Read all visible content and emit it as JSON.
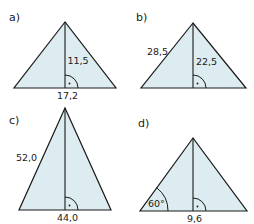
{
  "figures": [
    {
      "id": "a",
      "label": "a)",
      "height_label": "11,5",
      "base_label": "17,2",
      "right_angle_marker": true,
      "fill_color": "#dcecf0"
    },
    {
      "id": "b",
      "label": "b)",
      "side_label": "28,5",
      "height_label": "22,5",
      "right_angle_marker": true,
      "fill_color": "#dcecf0"
    },
    {
      "id": "c",
      "label": "c)",
      "side_label": "52,0",
      "base_label": "44,0",
      "right_angle_marker": true,
      "fill_color": "#dcecf0"
    },
    {
      "id": "d",
      "label": "d)",
      "angle_label": "60°",
      "base_label": "9,6",
      "right_angle_marker": true,
      "fill_color": "#dcecf0"
    }
  ]
}
